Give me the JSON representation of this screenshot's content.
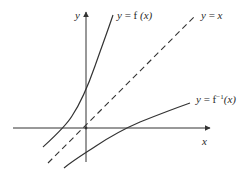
{
  "diagram": {
    "axes": {
      "x_label": "x",
      "y_label": "y"
    },
    "curves": [
      {
        "id": "f",
        "label_prefix": "y = f",
        "label_arg": "(x)",
        "style": "solid"
      },
      {
        "id": "identity",
        "label_prefix": "y = ",
        "label_arg": "x",
        "style": "dashed"
      },
      {
        "id": "f_inverse",
        "label_prefix": "y = f",
        "label_sup": "−1",
        "label_arg": "(x)",
        "style": "solid"
      }
    ],
    "colors": {
      "stroke": "#333333",
      "text": "#2a2a2a",
      "background": "#ffffff"
    }
  }
}
